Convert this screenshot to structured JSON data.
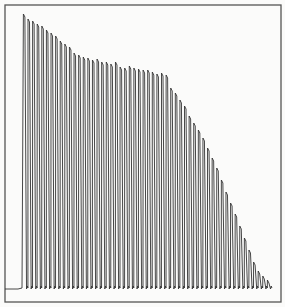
{
  "chart_data": {
    "type": "line",
    "title": "",
    "xlabel": "",
    "ylabel": "",
    "grid": false,
    "legend": null,
    "frame": {
      "left": 5,
      "top": 5,
      "right": 281,
      "bottom": 302
    },
    "baseline_y": 288,
    "pre_trace": {
      "x_start": 5,
      "x_end": 18,
      "y": 289
    },
    "first_peak_x": 24,
    "peak_spacing": 5.45,
    "peak_heights_px_from_baseline": [
      274,
      269,
      267,
      264,
      262,
      258,
      255,
      252,
      247,
      244,
      241,
      235,
      233,
      231,
      230,
      228,
      229,
      226,
      226,
      224,
      226,
      221,
      220,
      222,
      220,
      219,
      218,
      218,
      216,
      214,
      215,
      213,
      200,
      195,
      188,
      182,
      172,
      165,
      158,
      150,
      140,
      130,
      120,
      108,
      96,
      85,
      74,
      62,
      50,
      38,
      26,
      17,
      12,
      8
    ],
    "colors": {
      "trace": "#333333",
      "frame": "#555555",
      "background": "#fbfbfa"
    }
  }
}
